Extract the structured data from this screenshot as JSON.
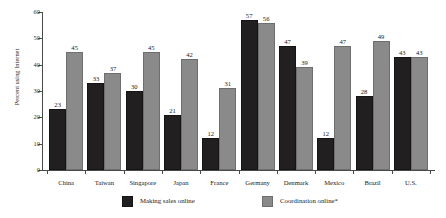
{
  "chart_data": {
    "type": "bar",
    "title": "",
    "xlabel": "",
    "ylabel": "Percent using Internet",
    "ylim": [
      0,
      60
    ],
    "yticks": [
      0,
      10,
      20,
      30,
      40,
      50,
      60
    ],
    "grid": false,
    "legend_position": "bottom",
    "categories": [
      "China",
      "Taiwan",
      "Singapore",
      "Japan",
      "France",
      "Germany",
      "Denmark",
      "Mexico",
      "Brazil",
      "U.S."
    ],
    "series": [
      {
        "name": "Making sales online",
        "color": "#211f1f",
        "values": [
          23,
          33,
          30,
          21,
          12,
          57,
          47,
          12,
          28,
          43
        ]
      },
      {
        "name": "Coordination online*",
        "color": "#8a8a8a",
        "values": [
          45,
          37,
          45,
          42,
          31,
          56,
          39,
          47,
          49,
          43
        ]
      }
    ]
  },
  "axis": {
    "y_title": "Percent using Internet",
    "y_tick_labels": [
      "0",
      "10",
      "20",
      "30",
      "40",
      "50",
      "60"
    ]
  },
  "legend": {
    "items": [
      {
        "label": "Making sales online",
        "swatch": "dark-swatch-icon"
      },
      {
        "label": "Coordination online*",
        "swatch": "gray-swatch-icon"
      }
    ]
  }
}
